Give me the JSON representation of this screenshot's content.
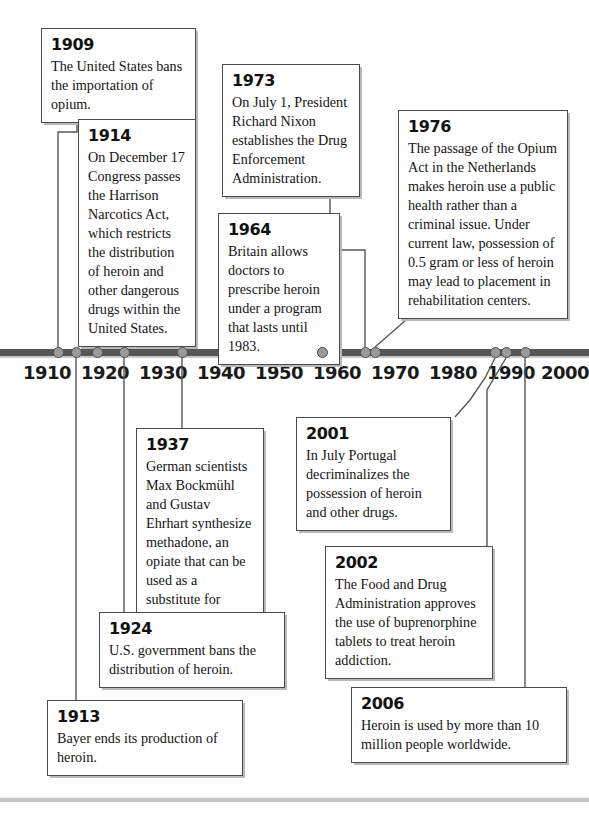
{
  "timeline": {
    "axis": {
      "year_ticks": [
        {
          "label": "1910",
          "x": 47
        },
        {
          "label": "1920",
          "x": 105
        },
        {
          "label": "1930",
          "x": 163
        },
        {
          "label": "1940",
          "x": 221
        },
        {
          "label": "1950",
          "x": 279
        },
        {
          "label": "1960",
          "x": 337
        },
        {
          "label": "1970",
          "x": 395
        },
        {
          "label": "1980",
          "x": 453
        },
        {
          "label": "1990",
          "x": 511
        },
        {
          "label": "2000",
          "x": 565
        }
      ],
      "markers": [
        {
          "year": "1909",
          "x": 58
        },
        {
          "year": "1913",
          "x": 76
        },
        {
          "year": "1914",
          "x": 97
        },
        {
          "year": "1924",
          "x": 124
        },
        {
          "year": "1937",
          "x": 182
        },
        {
          "year": "1964",
          "x": 322
        },
        {
          "year": "1973",
          "x": 365
        },
        {
          "year": "1976",
          "x": 375
        },
        {
          "year": "2001",
          "x": 495
        },
        {
          "year": "2002",
          "x": 506
        },
        {
          "year": "2006",
          "x": 525
        }
      ]
    },
    "events": [
      {
        "id": "event-1909",
        "year": "1909",
        "text": "The United States bans the importation of opium."
      },
      {
        "id": "event-1914",
        "year": "1914",
        "text": "On December 17 Congress passes the Harrison Narcotics Act, which restricts the distribution of heroin and other dangerous drugs within the United States."
      },
      {
        "id": "event-1973",
        "year": "1973",
        "text": "On July 1, President Richard Nixon estab­lishes the Drug Enforce­ment Administration."
      },
      {
        "id": "event-1976",
        "year": "1976",
        "text": "The passage of the Opium Act in the Netherlands makes heroin use a public health rather than a criminal issue. Under current law, possession of 0.5 gram or less of heroin may lead to placement in rehabilitation centers."
      },
      {
        "id": "event-1964",
        "year": "1964",
        "text": "Britain allows doc­tors to prescribe heroin under a program that lasts until 1983."
      },
      {
        "id": "event-1937",
        "year": "1937",
        "text": "German scientists Max Bockmühl and Gustav Ehrhart synthesize metha­done, an opiate that can be used as a substitute for morphine."
      },
      {
        "id": "event-2001",
        "year": "2001",
        "text": "In July Portugal decrimi­nalizes the possession of heroin and other drugs."
      },
      {
        "id": "event-2002",
        "year": "2002",
        "text": "The Food and Drug Admin­istration approves the use of buprenorphine tablets to treat heroin addiction."
      },
      {
        "id": "event-1924",
        "year": "1924",
        "text": "U.S. government bans the distribution of heroin."
      },
      {
        "id": "event-1913",
        "year": "1913",
        "text": "Bayer ends its production of heroin."
      },
      {
        "id": "event-2006",
        "year": "2006",
        "text": "Heroin is used by more than 10 million people worldwide."
      }
    ]
  },
  "colors": {
    "axis": "#565656",
    "marker_fill": "#9a9a9a",
    "marker_stroke": "#4e4e4e",
    "box_border": "#4a4a4a",
    "box_shadow": "#b9b9b9",
    "text": "#141414"
  }
}
